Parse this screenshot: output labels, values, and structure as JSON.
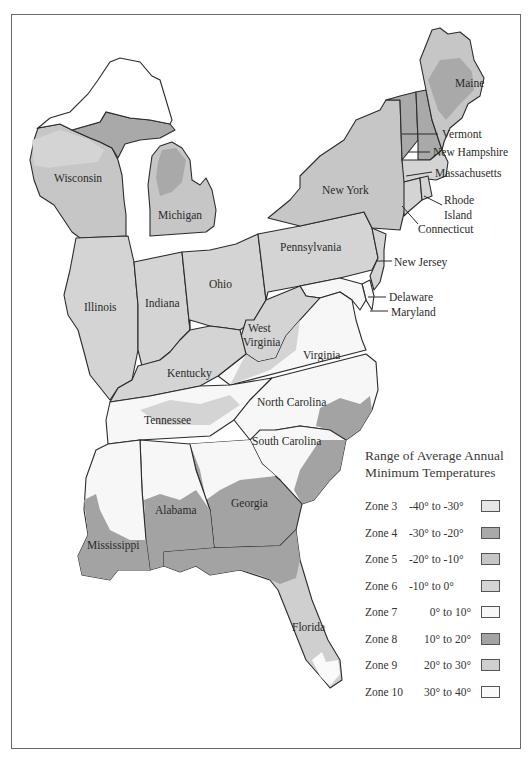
{
  "map": {
    "title": "Eastern United States Plant Hardiness Zones",
    "state_labels": {
      "maine": "Maine",
      "vermont": "Vermont",
      "new_hampshire": "New Hampshire",
      "massachusetts": "Massachusetts",
      "rhode_island_1": "Rhode",
      "rhode_island_2": "Island",
      "connecticut": "Connecticut",
      "new_york": "New York",
      "new_jersey": "New Jersey",
      "pennsylvania": "Pennsylvania",
      "delaware": "Delaware",
      "maryland": "Maryland",
      "wisconsin": "Wisconsin",
      "michigan": "Michigan",
      "illinois": "Illinois",
      "indiana": "Indiana",
      "ohio": "Ohio",
      "west_virginia_1": "West",
      "west_virginia_2": "Virginia",
      "virginia": "Virginia",
      "kentucky": "Kentucky",
      "tennessee": "Tennessee",
      "north_carolina": "North Carolina",
      "south_carolina": "South Carolina",
      "georgia": "Georgia",
      "alabama": "Alabama",
      "mississippi": "Mississippi",
      "florida": "Florida"
    }
  },
  "legend": {
    "title_line1": "Range of Average Annual",
    "title_line2": "Minimum Temperatures",
    "zones": [
      {
        "zone": "Zone 3",
        "range": "-40° to -30°",
        "color": "#e6e6e6"
      },
      {
        "zone": "Zone 4",
        "range": "-30° to -20°",
        "color": "#a9a9a9"
      },
      {
        "zone": "Zone 5",
        "range": "-20° to -10°",
        "color": "#c6c6c6"
      },
      {
        "zone": "Zone 6",
        "range": "-10° to 0°",
        "color": "#d4d4d4"
      },
      {
        "zone": "Zone 7",
        "range": "0° to 10°",
        "color": "#f7f7f7"
      },
      {
        "zone": "Zone 8",
        "range": "10° to 20°",
        "color": "#a3a3a3"
      },
      {
        "zone": "Zone 9",
        "range": "20° to 30°",
        "color": "#cfcfcf"
      },
      {
        "zone": "Zone 10",
        "range": "30° to 40°",
        "color": "#fafafa"
      }
    ]
  }
}
